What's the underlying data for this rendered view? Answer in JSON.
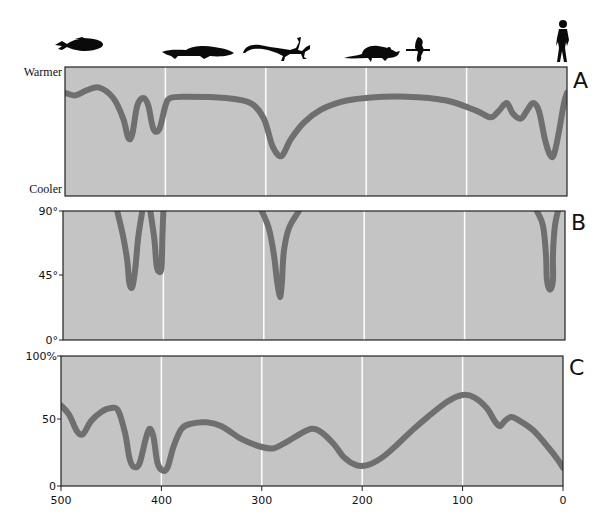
{
  "chart_data": [
    {
      "panel": "A",
      "type": "line",
      "title": "",
      "xlabel": "",
      "ylabel": "",
      "y_top_label": "Warmer",
      "y_bottom_label": "Cooler",
      "xlim": [
        500,
        0
      ],
      "ylim": [
        0,
        100
      ],
      "grid": {
        "vertical_at": [
          400,
          300,
          200,
          100
        ]
      },
      "points": [
        [
          500,
          80
        ],
        [
          490,
          78
        ],
        [
          478,
          82
        ],
        [
          466,
          84
        ],
        [
          452,
          76
        ],
        [
          442,
          60
        ],
        [
          437,
          45
        ],
        [
          433,
          48
        ],
        [
          428,
          70
        ],
        [
          422,
          76
        ],
        [
          417,
          70
        ],
        [
          412,
          52
        ],
        [
          406,
          52
        ],
        [
          400,
          70
        ],
        [
          395,
          76
        ],
        [
          380,
          77
        ],
        [
          340,
          76
        ],
        [
          315,
          72
        ],
        [
          302,
          60
        ],
        [
          294,
          40
        ],
        [
          288,
          32
        ],
        [
          283,
          32
        ],
        [
          275,
          44
        ],
        [
          262,
          57
        ],
        [
          245,
          67
        ],
        [
          225,
          73
        ],
        [
          200,
          76
        ],
        [
          160,
          77
        ],
        [
          120,
          74
        ],
        [
          90,
          66
        ],
        [
          76,
          61
        ],
        [
          68,
          66
        ],
        [
          60,
          72
        ],
        [
          54,
          64
        ],
        [
          46,
          60
        ],
        [
          40,
          66
        ],
        [
          34,
          72
        ],
        [
          28,
          66
        ],
        [
          22,
          44
        ],
        [
          17,
          32
        ],
        [
          13,
          32
        ],
        [
          8,
          50
        ],
        [
          3,
          72
        ],
        [
          0,
          80
        ]
      ]
    },
    {
      "panel": "B",
      "type": "line",
      "title": "",
      "xlabel": "",
      "ylabel": "",
      "yticks": [
        "90°",
        "45°",
        "0°"
      ],
      "ytick_values": [
        90,
        45,
        0
      ],
      "xlim": [
        500,
        0
      ],
      "ylim": [
        0,
        90
      ],
      "grid": {
        "vertical_at": [
          400,
          300,
          200,
          100
        ]
      },
      "segments": [
        [
          [
            446,
            90
          ],
          [
            440,
            72
          ],
          [
            436,
            55
          ],
          [
            434,
            40
          ],
          [
            431,
            37
          ],
          [
            428,
            50
          ],
          [
            425,
            72
          ],
          [
            421,
            90
          ]
        ],
        [
          [
            413,
            90
          ],
          [
            409,
            70
          ],
          [
            407,
            53
          ],
          [
            405,
            48
          ],
          [
            402,
            50
          ],
          [
            401,
            72
          ],
          [
            400,
            90
          ]
        ],
        [
          [
            302,
            90
          ],
          [
            295,
            78
          ],
          [
            290,
            60
          ],
          [
            287,
            42
          ],
          [
            284,
            30
          ],
          [
            282,
            40
          ],
          [
            280,
            62
          ],
          [
            275,
            78
          ],
          [
            265,
            90
          ]
        ],
        [
          [
            28,
            90
          ],
          [
            22,
            80
          ],
          [
            19,
            60
          ],
          [
            18,
            42
          ],
          [
            15,
            35
          ],
          [
            12,
            42
          ],
          [
            12,
            60
          ],
          [
            10,
            80
          ],
          [
            7,
            90
          ]
        ]
      ]
    },
    {
      "panel": "C",
      "type": "line",
      "title": "",
      "xlabel": "",
      "ylabel": "",
      "yticks": [
        "100%",
        "50",
        "0"
      ],
      "ytick_values": [
        100,
        50,
        0
      ],
      "xticks": [
        "500",
        "400",
        "300",
        "200",
        "100",
        "0"
      ],
      "xtick_values": [
        500,
        400,
        300,
        200,
        100,
        0
      ],
      "xlim": [
        500,
        0
      ],
      "ylim": [
        0,
        100
      ],
      "grid": {
        "vertical_at": [
          400,
          300,
          200,
          100
        ]
      },
      "points": [
        [
          500,
          62
        ],
        [
          492,
          55
        ],
        [
          484,
          42
        ],
        [
          478,
          40
        ],
        [
          470,
          50
        ],
        [
          460,
          57
        ],
        [
          450,
          60
        ],
        [
          443,
          58
        ],
        [
          436,
          40
        ],
        [
          432,
          22
        ],
        [
          428,
          15
        ],
        [
          422,
          17
        ],
        [
          416,
          35
        ],
        [
          412,
          44
        ],
        [
          408,
          38
        ],
        [
          404,
          18
        ],
        [
          399,
          12
        ],
        [
          394,
          14
        ],
        [
          388,
          30
        ],
        [
          380,
          44
        ],
        [
          370,
          48
        ],
        [
          355,
          49
        ],
        [
          340,
          46
        ],
        [
          320,
          36
        ],
        [
          300,
          30
        ],
        [
          288,
          29
        ],
        [
          275,
          34
        ],
        [
          262,
          40
        ],
        [
          250,
          44
        ],
        [
          240,
          41
        ],
        [
          228,
          32
        ],
        [
          218,
          22
        ],
        [
          206,
          16
        ],
        [
          195,
          16
        ],
        [
          180,
          22
        ],
        [
          165,
          32
        ],
        [
          150,
          43
        ],
        [
          135,
          53
        ],
        [
          115,
          65
        ],
        [
          100,
          70
        ],
        [
          88,
          68
        ],
        [
          76,
          60
        ],
        [
          68,
          50
        ],
        [
          63,
          46
        ],
        [
          58,
          50
        ],
        [
          52,
          53
        ],
        [
          45,
          51
        ],
        [
          30,
          43
        ],
        [
          15,
          30
        ],
        [
          5,
          20
        ],
        [
          0,
          14
        ]
      ]
    }
  ],
  "panel_labels": [
    "A",
    "B",
    "C"
  ],
  "panel_a": {
    "top_label": "Warmer",
    "bottom_label": "Cooler"
  },
  "panel_b": {
    "ticks": [
      "90°",
      "45°",
      "0°"
    ]
  },
  "panel_c": {
    "ticks": [
      "100%",
      "50",
      "0"
    ],
    "xticks": [
      "500",
      "400",
      "300",
      "200",
      "100",
      "0"
    ]
  },
  "silhouettes": [
    {
      "name": "fish",
      "icon": "fish-icon"
    },
    {
      "name": "early-amphibian",
      "icon": "amphibian-icon"
    },
    {
      "name": "reptile",
      "icon": "lizard-icon"
    },
    {
      "name": "mammal",
      "icon": "rodent-icon"
    },
    {
      "name": "bird",
      "icon": "bird-icon"
    },
    {
      "name": "human",
      "icon": "human-icon"
    }
  ],
  "colors": {
    "panel_bg": "#c4c4c4",
    "curve": "#6f6f6f",
    "grid": "#ffffff",
    "frame": "#222222"
  }
}
